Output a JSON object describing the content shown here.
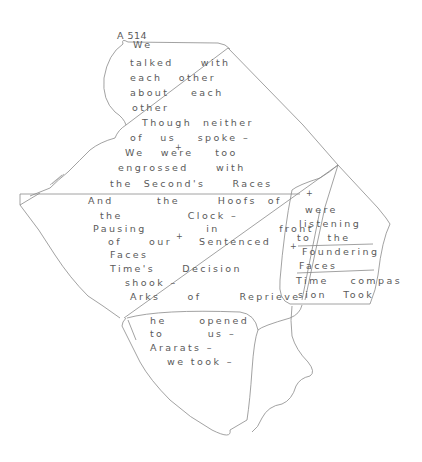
{
  "document": {
    "label": "A 514",
    "panels": {
      "main": {
        "lines": [
          {
            "text": "We",
            "x": 133,
            "y": 47
          },
          {
            "text": "talked     with",
            "x": 130,
            "y": 65
          },
          {
            "text": "each   other",
            "x": 130,
            "y": 80
          },
          {
            "text": "about    each",
            "x": 130,
            "y": 95
          },
          {
            "text": "other",
            "x": 132,
            "y": 110
          },
          {
            "text": "Though  neither",
            "x": 142,
            "y": 125
          },
          {
            "text": "of   us    spoke –",
            "x": 130,
            "y": 140
          },
          {
            "text": "We   were    too",
            "x": 125,
            "y": 155
          },
          {
            "text": "engrossed     with",
            "x": 118,
            "y": 170
          },
          {
            "text": "the  Second's     Races",
            "x": 110,
            "y": 186
          },
          {
            "text": "And        the       Hoofs  of",
            "x": 88,
            "y": 203
          },
          {
            "text": "the            Clock –",
            "x": 100,
            "y": 218
          },
          {
            "text": "Pausing           in           front",
            "x": 93,
            "y": 231
          },
          {
            "text": "of     our     Sentenced",
            "x": 108,
            "y": 244
          },
          {
            "text": "Faces",
            "x": 110,
            "y": 257
          },
          {
            "text": "Time's     Decision",
            "x": 110,
            "y": 271
          },
          {
            "text": "shook –",
            "x": 125,
            "y": 285
          },
          {
            "text": "Arks     of       Reprieve",
            "x": 130,
            "y": 299
          }
        ],
        "plus_marks": [
          {
            "text": "+",
            "x": 175,
            "y": 151
          },
          {
            "text": "+",
            "x": 176,
            "y": 240
          }
        ]
      },
      "right": {
        "lines": [
          {
            "text": "were",
            "x": 305,
            "y": 212
          },
          {
            "text": "listening",
            "x": 299,
            "y": 226
          },
          {
            "text": "to   the",
            "x": 297,
            "y": 240
          },
          {
            "text": "Foundering",
            "x": 302,
            "y": 254
          },
          {
            "text": "Faces",
            "x": 299,
            "y": 268
          },
          {
            "text": "Time    compas",
            "x": 296,
            "y": 283
          },
          {
            "text": "sion   Took",
            "x": 298,
            "y": 297
          }
        ],
        "plus_marks": [
          {
            "text": "+",
            "x": 306,
            "y": 197
          },
          {
            "text": "+",
            "x": 290,
            "y": 250
          }
        ]
      },
      "bottom": {
        "lines": [
          {
            "text": "he      opened",
            "x": 150,
            "y": 323
          },
          {
            "text": "to        us –",
            "x": 150,
            "y": 336
          },
          {
            "text": "Ararats –",
            "x": 150,
            "y": 350
          },
          {
            "text": "we took –",
            "x": 167,
            "y": 364
          }
        ]
      }
    }
  }
}
